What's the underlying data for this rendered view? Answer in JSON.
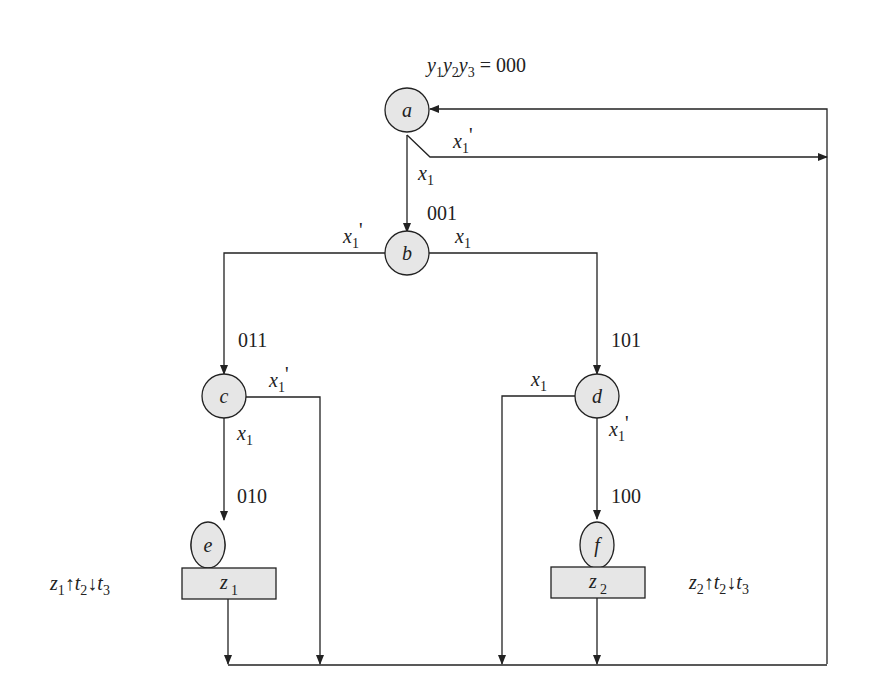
{
  "title": "y1y2y3 = 000",
  "header": {
    "vars": [
      "y",
      "y",
      "y"
    ],
    "subs": [
      "1",
      "2",
      "3"
    ],
    "eq": " = 000"
  },
  "states": [
    {
      "id": "a",
      "code": "000"
    },
    {
      "id": "b",
      "code": "001"
    },
    {
      "id": "c",
      "code": "011"
    },
    {
      "id": "d",
      "code": "101"
    },
    {
      "id": "e",
      "code": "010"
    },
    {
      "id": "f",
      "code": "100"
    }
  ],
  "outputs": [
    {
      "state": "e",
      "var": "z",
      "sub": "1"
    },
    {
      "state": "f",
      "var": "z",
      "sub": "2"
    }
  ],
  "transitions": [
    {
      "from": "a",
      "to": "b",
      "cond": "x1"
    },
    {
      "from": "a",
      "to": "a",
      "cond": "x1'"
    },
    {
      "from": "b",
      "to": "c",
      "cond": "x1'"
    },
    {
      "from": "b",
      "to": "d",
      "cond": "x1"
    },
    {
      "from": "c",
      "to": "e",
      "cond": "x1"
    },
    {
      "from": "c",
      "to": "a",
      "cond": "x1'"
    },
    {
      "from": "d",
      "to": "a",
      "cond": "x1"
    },
    {
      "from": "d",
      "to": "f",
      "cond": "x1'"
    },
    {
      "from": "e",
      "to": "a",
      "cond": ""
    },
    {
      "from": "f",
      "to": "a",
      "cond": ""
    }
  ],
  "cond_label": {
    "var": "x",
    "sub": "1",
    "prime": "'"
  },
  "annotations": [
    {
      "text": "z1↑t2↓t3",
      "parts": [
        "z",
        "1",
        "↑",
        "t",
        "2",
        "↓",
        "t",
        "3"
      ]
    },
    {
      "text": "z2↑t2↓t3",
      "parts": [
        "z",
        "2",
        "↑",
        "t",
        "2",
        "↓",
        "t",
        "3"
      ]
    }
  ]
}
